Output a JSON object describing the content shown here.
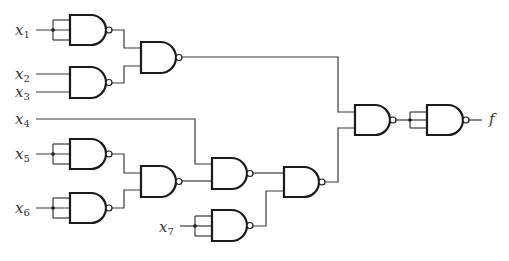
{
  "inputs": [
    {
      "id": "x1",
      "base": "x",
      "sub": "1",
      "x": 15,
      "y": 23
    },
    {
      "id": "x2",
      "base": "x",
      "sub": "2",
      "x": 15,
      "y": 67
    },
    {
      "id": "x3",
      "base": "x",
      "sub": "3",
      "x": 15,
      "y": 85
    },
    {
      "id": "x4",
      "base": "x",
      "sub": "4",
      "x": 15,
      "y": 112
    },
    {
      "id": "x5",
      "base": "x",
      "sub": "5",
      "x": 15,
      "y": 147
    },
    {
      "id": "x6",
      "base": "x",
      "sub": "6",
      "x": 15,
      "y": 201
    },
    {
      "id": "x7",
      "base": "x",
      "sub": "7",
      "x": 159,
      "y": 220
    }
  ],
  "output": {
    "id": "f",
    "label": "f",
    "x": 489,
    "y": 112
  },
  "gates": [
    {
      "id": "g1",
      "type": "NAND",
      "x": 70,
      "y": 15,
      "w": 36,
      "h": 30
    },
    {
      "id": "g2",
      "type": "NAND",
      "x": 70,
      "y": 67,
      "w": 36,
      "h": 31
    },
    {
      "id": "g3",
      "type": "NAND",
      "x": 141,
      "y": 42,
      "w": 35,
      "h": 31
    },
    {
      "id": "g5",
      "type": "NAND",
      "x": 70,
      "y": 139,
      "w": 36,
      "h": 30
    },
    {
      "id": "g6",
      "type": "NAND",
      "x": 70,
      "y": 193,
      "w": 36,
      "h": 30
    },
    {
      "id": "g7",
      "type": "NAND",
      "x": 141,
      "y": 166,
      "w": 35,
      "h": 31
    },
    {
      "id": "g8",
      "type": "NAND",
      "x": 212,
      "y": 158,
      "w": 35,
      "h": 31
    },
    {
      "id": "g10",
      "type": "NAND",
      "x": 212,
      "y": 210,
      "w": 35,
      "h": 31
    },
    {
      "id": "g9",
      "type": "NAND",
      "x": 284,
      "y": 167,
      "w": 35,
      "h": 30
    },
    {
      "id": "g11",
      "type": "NAND",
      "x": 355,
      "y": 105,
      "w": 35,
      "h": 30
    },
    {
      "id": "g12",
      "type": "NAND",
      "x": 427,
      "y": 105,
      "w": 36,
      "h": 30
    }
  ],
  "wires": [
    "M36,30 H70",
    "M53,20 V40",
    "M53,20 H70",
    "M53,40 H70",
    "M36,74 H70",
    "M36,92 H70",
    "M112,30 H124 V48 H141",
    "M112,83 H124 V66 H141",
    "M182,57 H338 V112 H355",
    "M36,119 H195 V164 H212",
    "M36,154 H70",
    "M53,144 H70",
    "M53,164 H70",
    "M53,144 V164",
    "M36,208 H70",
    "M53,198 H70",
    "M53,218 H70",
    "M53,198 V218",
    "M112,154 H124 V173 H141",
    "M112,208 H124 V190 H141",
    "M182,181 H212",
    "M253,173 H284",
    "M180,226 H212",
    "M195,216 H212",
    "M195,236 H212",
    "M195,216 V236",
    "M253,226 H266 V191 H284",
    "M325,182 H338 V128 H355",
    "M396,120 H427",
    "M410,112 H427",
    "M410,128 H427",
    "M410,112 V128",
    "M469,120 H482"
  ],
  "junctions": [
    {
      "x": 53,
      "y": 30
    },
    {
      "x": 53,
      "y": 154
    },
    {
      "x": 53,
      "y": 208
    },
    {
      "x": 195,
      "y": 226
    },
    {
      "x": 410,
      "y": 120
    }
  ]
}
